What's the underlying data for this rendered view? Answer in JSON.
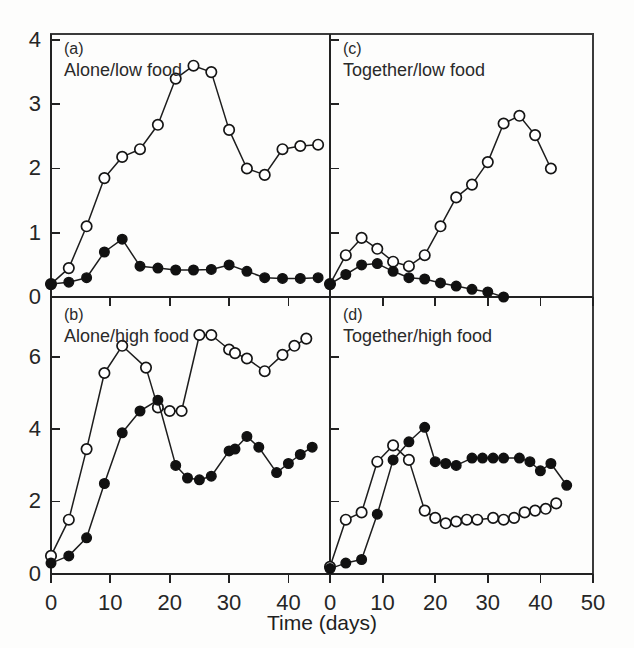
{
  "figure": {
    "xlabel": "Time (days)",
    "panel_count": 4,
    "marker_open_name": "open-circle",
    "marker_filled_name": "filled-circle",
    "line_color": "#1d1d1d",
    "open_fill_color": "#ffffff",
    "filled_fill_color": "#111111",
    "background_color": "#fdfdfc"
  },
  "axes": {
    "top_y_ticks": [
      "0",
      "1",
      "2",
      "3",
      "4"
    ],
    "bottom_y_ticks": [
      "0",
      "2",
      "4",
      "6"
    ],
    "left_x_ticks": [
      "0",
      "10",
      "20",
      "30",
      "40"
    ],
    "right_x_ticks": [
      "0",
      "10",
      "20",
      "30",
      "40",
      "50"
    ]
  },
  "chart_data": [
    {
      "type": "line",
      "panel": "a",
      "tag": "(a)",
      "title": "Alone/low food",
      "xlabel": "Time (days)",
      "ylabel": "",
      "xlim": [
        0,
        47
      ],
      "ylim": [
        0,
        4
      ],
      "xticks": [
        0,
        10,
        20,
        30,
        40
      ],
      "yticks": [
        0,
        1,
        2,
        3,
        4
      ],
      "grid": false,
      "legend": "none",
      "series": [
        {
          "name": "open-circle",
          "marker": "open-circle",
          "x": [
            0,
            3,
            6,
            9,
            12,
            15,
            18,
            21,
            24,
            27,
            30,
            33,
            36,
            39,
            42,
            45
          ],
          "values": [
            0.2,
            0.45,
            1.1,
            1.85,
            2.18,
            2.3,
            2.68,
            3.4,
            3.6,
            3.5,
            2.6,
            2.0,
            1.9,
            2.3,
            2.35,
            2.37
          ]
        },
        {
          "name": "filled-circle",
          "marker": "filled-circle",
          "x": [
            0,
            3,
            6,
            9,
            12,
            15,
            18,
            21,
            24,
            27,
            30,
            33,
            36,
            39,
            42,
            45
          ],
          "values": [
            0.2,
            0.23,
            0.3,
            0.7,
            0.9,
            0.48,
            0.45,
            0.42,
            0.42,
            0.43,
            0.5,
            0.4,
            0.3,
            0.29,
            0.29,
            0.3
          ]
        }
      ]
    },
    {
      "type": "line",
      "panel": "b",
      "tag": "(b)",
      "title": "Alone/high food",
      "xlabel": "Time (days)",
      "ylabel": "",
      "xlim": [
        0,
        47
      ],
      "ylim": [
        0,
        7.4
      ],
      "xticks": [
        0,
        10,
        20,
        30,
        40
      ],
      "yticks": [
        0,
        2,
        4,
        6
      ],
      "grid": false,
      "legend": "none",
      "series": [
        {
          "name": "open-circle",
          "marker": "open-circle",
          "x": [
            0,
            3,
            6,
            9,
            12,
            16,
            18,
            20,
            22,
            25,
            27,
            30,
            31,
            33,
            36,
            39,
            41,
            43
          ],
          "values": [
            0.5,
            1.5,
            3.45,
            5.55,
            6.3,
            5.7,
            4.6,
            4.5,
            4.5,
            6.6,
            6.6,
            6.2,
            6.1,
            5.95,
            5.6,
            6.05,
            6.3,
            6.5
          ]
        },
        {
          "name": "filled-circle",
          "marker": "filled-circle",
          "x": [
            0,
            3,
            6,
            9,
            12,
            15,
            18,
            21,
            23,
            25,
            27,
            30,
            31,
            33,
            35,
            38,
            40,
            42,
            44
          ],
          "values": [
            0.3,
            0.5,
            1.0,
            2.5,
            3.9,
            4.5,
            4.8,
            3.0,
            2.65,
            2.6,
            2.7,
            3.4,
            3.45,
            3.8,
            3.5,
            2.8,
            3.05,
            3.3,
            3.5
          ]
        }
      ]
    },
    {
      "type": "line",
      "panel": "c",
      "tag": "(c)",
      "title": "Together/low food",
      "xlabel": "Time (days)",
      "ylabel": "",
      "xlim": [
        0,
        50
      ],
      "ylim": [
        0,
        4
      ],
      "xticks": [
        0,
        10,
        20,
        30,
        40,
        50
      ],
      "yticks": [
        0,
        1,
        2,
        3,
        4
      ],
      "grid": false,
      "legend": "none",
      "series": [
        {
          "name": "open-circle",
          "marker": "open-circle",
          "x": [
            0,
            3,
            6,
            9,
            12,
            15,
            18,
            21,
            24,
            27,
            30,
            33,
            36,
            39,
            42
          ],
          "values": [
            0.2,
            0.65,
            0.92,
            0.75,
            0.55,
            0.48,
            0.65,
            1.1,
            1.55,
            1.75,
            2.1,
            2.7,
            2.82,
            2.52,
            2.0
          ]
        },
        {
          "name": "filled-circle",
          "marker": "filled-circle",
          "x": [
            0,
            3,
            6,
            9,
            12,
            15,
            18,
            21,
            24,
            27,
            30,
            33
          ],
          "values": [
            0.2,
            0.35,
            0.5,
            0.52,
            0.4,
            0.3,
            0.28,
            0.22,
            0.17,
            0.12,
            0.08,
            0.0
          ]
        }
      ]
    },
    {
      "type": "line",
      "panel": "d",
      "tag": "(d)",
      "title": "Together/high food",
      "xlabel": "Time (days)",
      "ylabel": "",
      "xlim": [
        0,
        50
      ],
      "ylim": [
        0,
        7.4
      ],
      "xticks": [
        0,
        10,
        20,
        30,
        40,
        50
      ],
      "yticks": [
        0,
        2,
        4,
        6
      ],
      "grid": false,
      "legend": "none",
      "series": [
        {
          "name": "open-circle",
          "marker": "open-circle",
          "x": [
            0,
            3,
            6,
            9,
            12,
            15,
            18,
            20,
            22,
            24,
            26,
            28,
            31,
            33,
            35,
            37,
            39,
            41,
            43
          ],
          "values": [
            0.2,
            1.5,
            1.7,
            3.1,
            3.55,
            3.15,
            1.75,
            1.55,
            1.4,
            1.45,
            1.5,
            1.5,
            1.55,
            1.5,
            1.55,
            1.7,
            1.75,
            1.8,
            1.95
          ]
        },
        {
          "name": "filled-circle",
          "marker": "filled-circle",
          "x": [
            0,
            3,
            6,
            9,
            12,
            15,
            18,
            20,
            22,
            24,
            27,
            29,
            31,
            33,
            36,
            38,
            40,
            42,
            45
          ],
          "values": [
            0.15,
            0.3,
            0.4,
            1.65,
            3.15,
            3.65,
            4.05,
            3.1,
            3.05,
            3.0,
            3.2,
            3.2,
            3.2,
            3.2,
            3.2,
            3.1,
            2.85,
            3.05,
            2.45
          ]
        }
      ]
    }
  ]
}
